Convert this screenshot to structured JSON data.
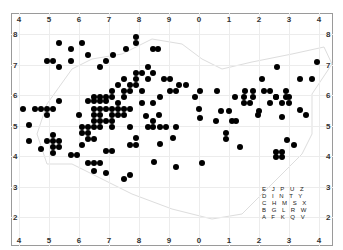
{
  "chart_data": {
    "type": "scatter",
    "title": "",
    "xlabel": "",
    "ylabel": "",
    "x_tick_labels_top": [
      "4",
      "5",
      "6",
      "7",
      "8",
      "9",
      "0",
      "1",
      "2",
      "3",
      "4"
    ],
    "x_tick_labels_bottom": [
      "4",
      "5",
      "6",
      "7",
      "8",
      "9",
      "0",
      "1",
      "2",
      "3",
      "4"
    ],
    "y_tick_labels_left": [
      "8",
      "7",
      "6",
      "5",
      "4",
      "3",
      "2"
    ],
    "y_tick_labels_right": [
      "8",
      "7",
      "6",
      "5",
      "4",
      "3",
      "2"
    ],
    "grid": true,
    "marker_color": "#000000",
    "points_px": [
      [
        59,
        43
      ],
      [
        82,
        43
      ],
      [
        71,
        49
      ],
      [
        88,
        55
      ],
      [
        47,
        61
      ],
      [
        53,
        61
      ],
      [
        71,
        61
      ],
      [
        59,
        67
      ],
      [
        100,
        67
      ],
      [
        106,
        61
      ],
      [
        113,
        55
      ],
      [
        126,
        49
      ],
      [
        136,
        43
      ],
      [
        136,
        37
      ],
      [
        153,
        49
      ],
      [
        158,
        49
      ],
      [
        35,
        109
      ],
      [
        29,
        125
      ],
      [
        41,
        109
      ],
      [
        47,
        109
      ],
      [
        53,
        109
      ],
      [
        47,
        115
      ],
      [
        23,
        109
      ],
      [
        59,
        101
      ],
      [
        79,
        115
      ],
      [
        88,
        101
      ],
      [
        94,
        101
      ],
      [
        100,
        101
      ],
      [
        106,
        101
      ],
      [
        94,
        109
      ],
      [
        100,
        109
      ],
      [
        106,
        109
      ],
      [
        112,
        109
      ],
      [
        118,
        109
      ],
      [
        94,
        97
      ],
      [
        100,
        97
      ],
      [
        106,
        97
      ],
      [
        112,
        97
      ],
      [
        124,
        97
      ],
      [
        112,
        91
      ],
      [
        124,
        91
      ],
      [
        130,
        91
      ],
      [
        118,
        85
      ],
      [
        124,
        79
      ],
      [
        130,
        85
      ],
      [
        136,
        85
      ],
      [
        136,
        79
      ],
      [
        136,
        73
      ],
      [
        142,
        73
      ],
      [
        148,
        67
      ],
      [
        153,
        73
      ],
      [
        148,
        79
      ],
      [
        142,
        91
      ],
      [
        94,
        115
      ],
      [
        100,
        115
      ],
      [
        112,
        115
      ],
      [
        118,
        115
      ],
      [
        124,
        115
      ],
      [
        112,
        121
      ],
      [
        94,
        121
      ],
      [
        100,
        121
      ],
      [
        106,
        121
      ],
      [
        124,
        109
      ],
      [
        130,
        109
      ],
      [
        118,
        103
      ],
      [
        142,
        103
      ],
      [
        88,
        127
      ],
      [
        94,
        127
      ],
      [
        100,
        127
      ],
      [
        112,
        127
      ],
      [
        130,
        127
      ],
      [
        148,
        127
      ],
      [
        160,
        127
      ],
      [
        166,
        127
      ],
      [
        176,
        127
      ],
      [
        53,
        141
      ],
      [
        53,
        135
      ],
      [
        59,
        141
      ],
      [
        59,
        147
      ],
      [
        47,
        141
      ],
      [
        53,
        147
      ],
      [
        41,
        149
      ],
      [
        29,
        141
      ],
      [
        53,
        153
      ],
      [
        82,
        127
      ],
      [
        88,
        133
      ],
      [
        82,
        133
      ],
      [
        88,
        139
      ],
      [
        82,
        145
      ],
      [
        94,
        139
      ],
      [
        106,
        151
      ],
      [
        112,
        151
      ],
      [
        130,
        145
      ],
      [
        136,
        138
      ],
      [
        136,
        145
      ],
      [
        160,
        144
      ],
      [
        71,
        155
      ],
      [
        77,
        155
      ],
      [
        88,
        163
      ],
      [
        94,
        163
      ],
      [
        100,
        163
      ],
      [
        94,
        171
      ],
      [
        106,
        173
      ],
      [
        124,
        179
      ],
      [
        130,
        175
      ],
      [
        153,
        127
      ],
      [
        154,
        162
      ],
      [
        176,
        167
      ],
      [
        202,
        163
      ],
      [
        173,
        138
      ],
      [
        199,
        109
      ],
      [
        164,
        79
      ],
      [
        170,
        79
      ],
      [
        170,
        91
      ],
      [
        176,
        91
      ],
      [
        200,
        91
      ],
      [
        217,
        91
      ],
      [
        235,
        97
      ],
      [
        245,
        91
      ],
      [
        253,
        91
      ],
      [
        253,
        97
      ],
      [
        259,
        111
      ],
      [
        277,
        67
      ],
      [
        262,
        79
      ],
      [
        276,
        97
      ],
      [
        286,
        91
      ],
      [
        286,
        97
      ],
      [
        289,
        97
      ],
      [
        289,
        103
      ],
      [
        300,
        79
      ],
      [
        312,
        79
      ],
      [
        317,
        62
      ],
      [
        179,
        85
      ],
      [
        186,
        85
      ],
      [
        195,
        97
      ],
      [
        160,
        97
      ],
      [
        153,
        103
      ],
      [
        146,
        116
      ],
      [
        159,
        115
      ],
      [
        153,
        121
      ],
      [
        244,
        97
      ],
      [
        244,
        103
      ],
      [
        264,
        91
      ],
      [
        270,
        91
      ],
      [
        250,
        103
      ],
      [
        258,
        115
      ],
      [
        232,
        121
      ],
      [
        236,
        121
      ],
      [
        226,
        133
      ],
      [
        226,
        139
      ],
      [
        240,
        147
      ],
      [
        270,
        103
      ],
      [
        276,
        97
      ],
      [
        282,
        103
      ],
      [
        300,
        110
      ],
      [
        306,
        115
      ],
      [
        282,
        117
      ],
      [
        287,
        140
      ],
      [
        294,
        145
      ],
      [
        276,
        152
      ],
      [
        282,
        152
      ],
      [
        276,
        157
      ],
      [
        282,
        157
      ],
      [
        229,
        111
      ],
      [
        221,
        111
      ],
      [
        216,
        121
      ],
      [
        200,
        118
      ]
    ]
  },
  "key_grid": {
    "rows": [
      "E J P U Z",
      "D I N T Y",
      "C H M S X",
      "B G L R W",
      "A F K Q V"
    ]
  }
}
